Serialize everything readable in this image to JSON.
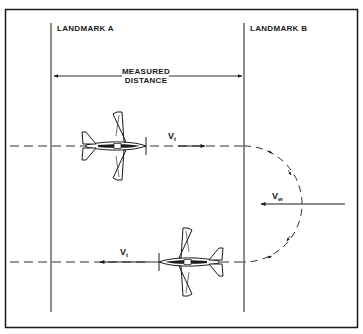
{
  "diagram": {
    "labels": {
      "landmark_a": "LANDMARK  A",
      "landmark_b": "LANDMARK  B",
      "measured_distance_line1": "MEASURED",
      "measured_distance_line2": "DISTANCE",
      "vt_top": {
        "main": "V",
        "sub": "t"
      },
      "vt_bottom": {
        "main": "V",
        "sub": "t"
      },
      "vw": {
        "main": "V",
        "sub": "w"
      }
    },
    "elements": {
      "aircraft_top_heading": "right",
      "aircraft_bottom_heading": "left",
      "turn_path": "semicircle-right-of-landmark-b",
      "wind_direction": "right-to-left"
    },
    "colors": {
      "ink": "#1a1a1a",
      "background": "#ffffff"
    }
  }
}
